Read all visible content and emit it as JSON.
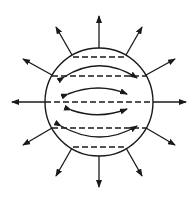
{
  "diagram": {
    "stroke_color": "#1a1a1a",
    "background": "#ffffff",
    "circle": {
      "cx": 99,
      "cy": 102,
      "r": 54
    },
    "radial_arrows_count": 12,
    "dashed_chords_count": 5,
    "curved_double_arrows_count": 4
  }
}
